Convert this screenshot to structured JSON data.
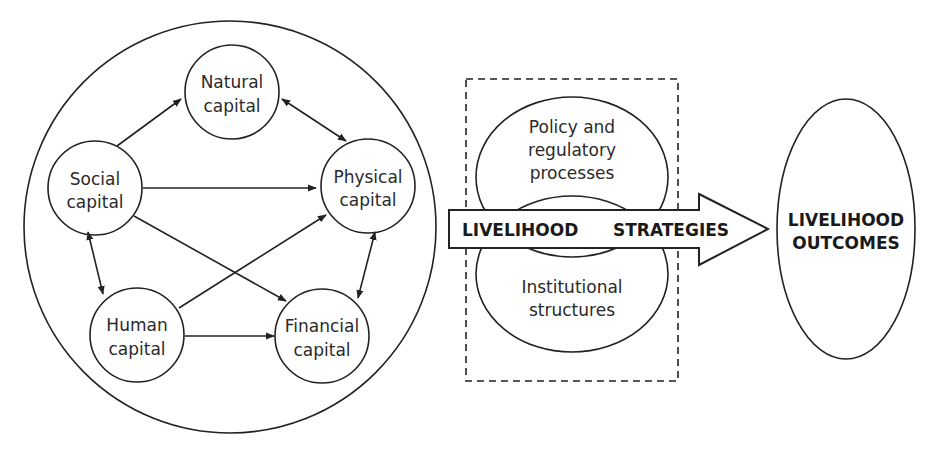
{
  "diagram": {
    "type": "sustainable-livelihoods-framework",
    "assets_group": {
      "nodes": [
        {
          "id": "natural",
          "line1": "Natural",
          "line2": "capital"
        },
        {
          "id": "social",
          "line1": "Social",
          "line2": "capital"
        },
        {
          "id": "physical",
          "line1": "Physical",
          "line2": "capital"
        },
        {
          "id": "human",
          "line1": "Human",
          "line2": "capital"
        },
        {
          "id": "financial",
          "line1": "Financial",
          "line2": "capital"
        }
      ],
      "edges": [
        {
          "from": "social",
          "to": "natural",
          "direction": "one-way"
        },
        {
          "from": "natural",
          "to": "physical",
          "direction": "two-way"
        },
        {
          "from": "social",
          "to": "physical",
          "direction": "one-way"
        },
        {
          "from": "social",
          "to": "human",
          "direction": "two-way"
        },
        {
          "from": "social",
          "to": "financial",
          "direction": "one-way"
        },
        {
          "from": "human",
          "to": "physical",
          "direction": "one-way"
        },
        {
          "from": "human",
          "to": "financial",
          "direction": "one-way"
        },
        {
          "from": "physical",
          "to": "financial",
          "direction": "two-way"
        }
      ]
    },
    "transforming_structures": {
      "upper": {
        "line1": "Policy and",
        "line2": "regulatory",
        "line3": "processes"
      },
      "lower": {
        "line1": "Institutional",
        "line2": "structures"
      }
    },
    "arrow": {
      "word1": "LIVELIHOOD",
      "word2": "STRATEGIES"
    },
    "outcome": {
      "line1": "LIVELIHOOD",
      "line2": "OUTCOMES"
    }
  },
  "colors": {
    "stroke": "#222222",
    "background": "#ffffff",
    "text": "#2a2a2a"
  }
}
